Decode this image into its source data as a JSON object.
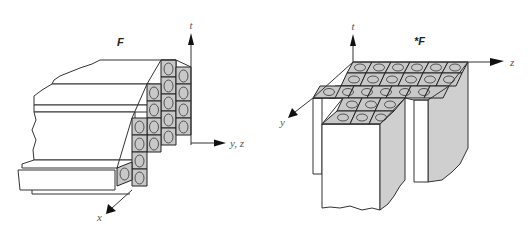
{
  "figure": {
    "left_panel": {
      "title": "F",
      "axes": {
        "vertical": "t",
        "horizontal": "y, z",
        "depth": "x"
      },
      "grid": {
        "columns": 4,
        "rows_visible": 5,
        "description": "staggered stack of cells with rotation arrows on front face"
      }
    },
    "right_panel": {
      "title": "*F",
      "axes": {
        "vertical": "t",
        "horizontal": "z",
        "depth": "y"
      },
      "grid": {
        "top_rows": 3,
        "top_columns": 6,
        "extension_rows": 2,
        "extension_columns": 3,
        "description": "top surface of cells with rotation arrows, extruded downward"
      }
    }
  }
}
